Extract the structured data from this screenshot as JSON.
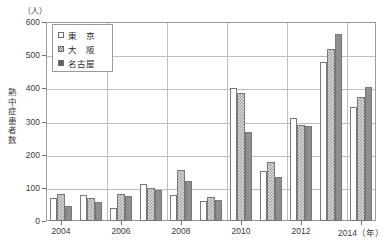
{
  "chart_data": {
    "type": "bar",
    "title": "",
    "unit_label": "（人）",
    "ylabel": "熱中症患者数",
    "xlabel": "（年）",
    "categories": [
      "2004",
      "2005",
      "2006",
      "2007",
      "2008",
      "2009",
      "2010",
      "2011",
      "2012",
      "2013",
      "2014"
    ],
    "x_tick_labels": [
      "2004",
      "2006",
      "2008",
      "2010",
      "2012",
      "2014（年）"
    ],
    "x_tick_categories": [
      "2004",
      "2006",
      "2008",
      "2010",
      "2012",
      "2014"
    ],
    "y_tick_labels": [
      "0",
      "100",
      "200",
      "300",
      "400",
      "500",
      "600"
    ],
    "ylim": [
      0,
      600
    ],
    "ytick_step": 100,
    "grid": "horizontal-and-vertical",
    "legend_position": "top-left-inside",
    "series": [
      {
        "name": "東　京",
        "key": "tokyo",
        "values": [
          70,
          78,
          40,
          113,
          78,
          60,
          400,
          152,
          312,
          478,
          345
        ]
      },
      {
        "name": "大　阪",
        "key": "osaka",
        "values": [
          80,
          68,
          80,
          100,
          155,
          72,
          385,
          178,
          290,
          518,
          375
        ]
      },
      {
        "name": "名古屋",
        "key": "nagoya",
        "values": [
          45,
          58,
          75,
          95,
          122,
          62,
          268,
          132,
          285,
          563,
          405
        ]
      }
    ]
  },
  "legend": {
    "items": [
      {
        "label": "東　京",
        "key": "tokyo"
      },
      {
        "label": "大　阪",
        "key": "osaka"
      },
      {
        "label": "名古屋",
        "key": "nagoya"
      }
    ]
  }
}
